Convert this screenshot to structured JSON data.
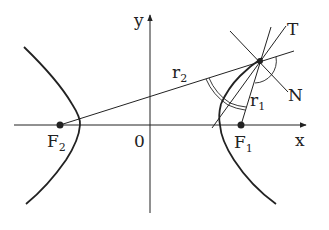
{
  "diagram": {
    "colors": {
      "stroke": "#222222",
      "background": "#ffffff"
    },
    "axes": {
      "x_label": "x",
      "y_label": "y",
      "origin_label": "0"
    },
    "foci": [
      {
        "name": "F",
        "sub": "1"
      },
      {
        "name": "F",
        "sub": "2"
      }
    ],
    "radii": [
      {
        "name": "r",
        "sub": "1"
      },
      {
        "name": "r",
        "sub": "2"
      }
    ],
    "lines": {
      "tangent_label": "T",
      "normal_label": "N"
    }
  }
}
